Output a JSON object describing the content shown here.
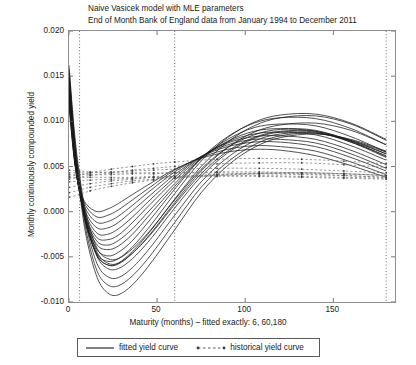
{
  "chart_data": {
    "type": "line",
    "title": "Naive Vasicek model with MLE parameters",
    "subtitle": "End of Month Bank of England data from January 1994 to December 2011",
    "xlabel": "Maturity (months) – fitted exactly: 6, 60,180",
    "ylabel": "Monthly continuously compounded yield",
    "xlim": [
      0,
      185
    ],
    "ylim": [
      -0.01,
      0.02
    ],
    "xticks": [
      0,
      50,
      100,
      150
    ],
    "xtick_labels": [
      "0",
      "50",
      "100",
      "150"
    ],
    "yticks": [
      0.02,
      0.015,
      0.01,
      0.005,
      0.0,
      -0.005,
      -0.01
    ],
    "ytick_labels": [
      "0.020",
      "0.015",
      "0.010",
      "0.005",
      "0.000",
      "-0.005",
      "-0.010"
    ],
    "grid": "vertical dotted gridlines at fitted maturities",
    "gridlines_x": [
      6,
      60,
      180
    ],
    "legend_position": "below-axis",
    "legend": [
      {
        "label": "fitted yield curve",
        "style": "solid",
        "color": "#1a1a1a"
      },
      {
        "label": "historical yield curve",
        "style": "dashed-with-markers",
        "color": "#7a7a7a"
      }
    ],
    "series": [
      {
        "name": "fitted yield curve 1",
        "style": "solid",
        "x": [
          0,
          3,
          6,
          10,
          16,
          22,
          28,
          36,
          46,
          60,
          75,
          90,
          105,
          120,
          140,
          160,
          180
        ],
        "y": [
          0.0162,
          0.009,
          0.004,
          -0.0005,
          -0.0041,
          -0.0052,
          -0.0052,
          -0.0041,
          -0.0021,
          0.0013,
          0.0047,
          0.0071,
          0.0085,
          0.0091,
          0.0089,
          0.0077,
          0.006
        ]
      },
      {
        "name": "fitted yield curve 2",
        "style": "solid",
        "x": [
          0,
          3,
          6,
          10,
          16,
          22,
          28,
          36,
          46,
          60,
          75,
          90,
          105,
          120,
          140,
          160,
          180
        ],
        "y": [
          0.0158,
          0.0085,
          0.0036,
          -0.0012,
          -0.005,
          -0.0063,
          -0.0063,
          -0.0052,
          -0.0031,
          0.0004,
          0.0039,
          0.0065,
          0.0081,
          0.0088,
          0.0088,
          0.0077,
          0.0062
        ]
      },
      {
        "name": "fitted yield curve 3",
        "style": "solid",
        "x": [
          0,
          3,
          6,
          10,
          16,
          22,
          28,
          36,
          46,
          60,
          75,
          90,
          105,
          120,
          140,
          160,
          180
        ],
        "y": [
          0.0155,
          0.008,
          0.0031,
          -0.0018,
          -0.0058,
          -0.0072,
          -0.0073,
          -0.0062,
          -0.004,
          -0.0004,
          0.0033,
          0.006,
          0.0078,
          0.0086,
          0.0087,
          0.0078,
          0.0064
        ]
      },
      {
        "name": "fitted yield curve 4",
        "style": "solid",
        "x": [
          0,
          3,
          6,
          10,
          16,
          22,
          28,
          36,
          46,
          60,
          75,
          90,
          105,
          120,
          140,
          160,
          180
        ],
        "y": [
          0.0152,
          0.0076,
          0.0027,
          -0.0024,
          -0.0066,
          -0.0081,
          -0.0082,
          -0.0071,
          -0.0049,
          -0.0012,
          0.0027,
          0.0055,
          0.0074,
          0.0084,
          0.0087,
          0.0079,
          0.0066
        ]
      },
      {
        "name": "fitted yield curve 5",
        "style": "solid",
        "x": [
          0,
          3,
          6,
          10,
          16,
          22,
          28,
          36,
          46,
          60,
          75,
          90,
          105,
          120,
          140,
          160,
          180
        ],
        "y": [
          0.015,
          0.0073,
          0.0022,
          -0.003,
          -0.0073,
          -0.009,
          -0.0092,
          -0.0081,
          -0.0058,
          -0.002,
          0.0021,
          0.0051,
          0.0071,
          0.0082,
          0.0086,
          0.008,
          0.0067
        ]
      },
      {
        "name": "fitted yield curve 6",
        "style": "solid",
        "x": [
          0,
          3,
          6,
          10,
          16,
          22,
          28,
          36,
          46,
          60,
          75,
          90,
          105,
          120,
          140,
          160,
          180
        ],
        "y": [
          0.0147,
          0.0078,
          0.0033,
          -0.001,
          -0.0045,
          -0.0057,
          -0.0057,
          -0.0046,
          -0.0026,
          0.0008,
          0.0042,
          0.0067,
          0.0082,
          0.0089,
          0.0089,
          0.0079,
          0.0064
        ]
      },
      {
        "name": "fitted yield curve 7",
        "style": "solid",
        "x": [
          0,
          3,
          6,
          10,
          16,
          22,
          28,
          36,
          46,
          60,
          75,
          90,
          105,
          120,
          140,
          160,
          180
        ],
        "y": [
          0.0144,
          0.0074,
          0.0029,
          -0.0014,
          -0.0048,
          -0.0059,
          -0.0058,
          -0.0046,
          -0.0025,
          0.001,
          0.0045,
          0.0071,
          0.0088,
          0.0096,
          0.0098,
          0.009,
          0.0074
        ]
      },
      {
        "name": "fitted yield curve 8",
        "style": "solid",
        "x": [
          0,
          3,
          6,
          10,
          16,
          22,
          28,
          36,
          46,
          60,
          75,
          90,
          105,
          120,
          140,
          160,
          180
        ],
        "y": [
          0.0141,
          0.0071,
          0.0026,
          -0.0016,
          -0.0049,
          -0.0059,
          -0.0057,
          -0.0044,
          -0.0022,
          0.0014,
          0.005,
          0.0077,
          0.0095,
          0.0104,
          0.0106,
          0.0097,
          0.0079
        ]
      },
      {
        "name": "fitted yield curve 9",
        "style": "solid",
        "x": [
          0,
          3,
          6,
          10,
          16,
          22,
          28,
          36,
          46,
          60,
          75,
          90,
          105,
          120,
          140,
          160,
          180
        ],
        "y": [
          0.0138,
          0.0069,
          0.0024,
          -0.0017,
          -0.0047,
          -0.0055,
          -0.0052,
          -0.0039,
          -0.0016,
          0.002,
          0.0056,
          0.0082,
          0.0099,
          0.0107,
          0.0108,
          0.0098,
          0.008
        ]
      },
      {
        "name": "fitted yield curve 10",
        "style": "solid",
        "x": [
          0,
          3,
          6,
          10,
          16,
          22,
          28,
          36,
          46,
          60,
          75,
          90,
          105,
          120,
          140,
          160,
          180
        ],
        "y": [
          0.0136,
          0.0067,
          0.0023,
          -0.0015,
          -0.0042,
          -0.0049,
          -0.0045,
          -0.0032,
          -0.0009,
          0.0025,
          0.0059,
          0.0083,
          0.0098,
          0.0104,
          0.0103,
          0.0092,
          0.0074
        ]
      },
      {
        "name": "fitted yield curve 11",
        "style": "solid",
        "x": [
          0,
          3,
          6,
          10,
          16,
          22,
          28,
          36,
          46,
          60,
          75,
          90,
          105,
          120,
          140,
          160,
          180
        ],
        "y": [
          0.0134,
          0.0066,
          0.0022,
          -0.0013,
          -0.0037,
          -0.0042,
          -0.0038,
          -0.0025,
          -0.0003,
          0.0028,
          0.0059,
          0.008,
          0.0093,
          0.0097,
          0.0095,
          0.0083,
          0.0066
        ]
      },
      {
        "name": "fitted yield curve 12",
        "style": "solid",
        "x": [
          0,
          3,
          6,
          10,
          16,
          22,
          28,
          36,
          46,
          60,
          75,
          90,
          105,
          120,
          140,
          160,
          180
        ],
        "y": [
          0.0132,
          0.0064,
          0.0021,
          -0.0011,
          -0.0033,
          -0.0037,
          -0.0032,
          -0.0019,
          0.0002,
          0.0031,
          0.0059,
          0.0078,
          0.0089,
          0.0092,
          0.009,
          0.0078,
          0.0061
        ]
      },
      {
        "name": "fitted yield curve 13",
        "style": "solid",
        "x": [
          0,
          3,
          6,
          10,
          16,
          22,
          28,
          36,
          46,
          60,
          75,
          90,
          105,
          120,
          140,
          160,
          180
        ],
        "y": [
          0.013,
          0.0063,
          0.0021,
          -0.0009,
          -0.0029,
          -0.0031,
          -0.0026,
          -0.0012,
          0.0008,
          0.0035,
          0.006,
          0.0077,
          0.0086,
          0.0088,
          0.0085,
          0.0073,
          0.0057
        ]
      },
      {
        "name": "fitted yield curve 14",
        "style": "solid",
        "x": [
          0,
          3,
          6,
          10,
          16,
          22,
          28,
          36,
          46,
          60,
          75,
          90,
          105,
          120,
          140,
          160,
          180
        ],
        "y": [
          0.0128,
          0.0062,
          0.0022,
          -0.0006,
          -0.0024,
          -0.0025,
          -0.0019,
          -0.0006,
          0.0013,
          0.0038,
          0.0061,
          0.0076,
          0.0083,
          0.0084,
          0.008,
          0.0068,
          0.0052
        ]
      },
      {
        "name": "fitted yield curve 15",
        "style": "solid",
        "x": [
          0,
          3,
          6,
          10,
          16,
          22,
          28,
          36,
          46,
          60,
          75,
          90,
          105,
          120,
          140,
          160,
          180
        ],
        "y": [
          0.0126,
          0.0061,
          0.0023,
          -0.0003,
          -0.0018,
          -0.0018,
          -0.0012,
          0.0001,
          0.0018,
          0.0041,
          0.0061,
          0.0074,
          0.008,
          0.008,
          0.0076,
          0.0064,
          0.0048
        ]
      },
      {
        "name": "fitted yield curve 16",
        "style": "solid",
        "x": [
          0,
          3,
          6,
          10,
          16,
          22,
          28,
          36,
          46,
          60,
          75,
          90,
          105,
          120,
          140,
          160,
          180
        ],
        "y": [
          0.0123,
          0.006,
          0.0024,
          0.0001,
          -0.0012,
          -0.0011,
          -0.0005,
          0.0007,
          0.0023,
          0.0044,
          0.0061,
          0.0072,
          0.0077,
          0.0077,
          0.0072,
          0.006,
          0.0045
        ]
      },
      {
        "name": "fitted yield curve 17",
        "style": "solid",
        "x": [
          0,
          3,
          6,
          10,
          16,
          22,
          28,
          36,
          46,
          60,
          75,
          90,
          105,
          120,
          140,
          160,
          180
        ],
        "y": [
          0.012,
          0.0059,
          0.0025,
          0.0005,
          -0.0006,
          -0.0004,
          0.0002,
          0.0013,
          0.0027,
          0.0046,
          0.006,
          0.0069,
          0.0073,
          0.0072,
          0.0067,
          0.0055,
          0.0041
        ]
      },
      {
        "name": "fitted yield curve 18",
        "style": "solid",
        "x": [
          0,
          3,
          6,
          10,
          16,
          22,
          28,
          36,
          46,
          60,
          75,
          90,
          105,
          120,
          140,
          160,
          180
        ],
        "y": [
          0.0117,
          0.0057,
          0.0025,
          0.0008,
          0.0,
          0.0003,
          0.0009,
          0.0019,
          0.0031,
          0.0047,
          0.0059,
          0.0066,
          0.0069,
          0.0068,
          0.0062,
          0.0051,
          0.0038
        ]
      },
      {
        "name": "historical yield curve 1",
        "style": "dashed",
        "x": [
          0,
          6,
          12,
          24,
          36,
          48,
          60,
          84,
          108,
          132,
          156,
          180
        ],
        "y": [
          0.0039,
          0.0041,
          0.0043,
          0.0047,
          0.005,
          0.0053,
          0.0055,
          0.0058,
          0.0059,
          0.0058,
          0.0056,
          0.0053
        ]
      },
      {
        "name": "historical yield curve 2",
        "style": "dashed",
        "x": [
          0,
          6,
          12,
          24,
          36,
          48,
          60,
          84,
          108,
          132,
          156,
          180
        ],
        "y": [
          0.0036,
          0.0038,
          0.004,
          0.0043,
          0.0046,
          0.0048,
          0.005,
          0.0053,
          0.0054,
          0.0054,
          0.0052,
          0.0049
        ]
      },
      {
        "name": "historical yield curve 3",
        "style": "dashed",
        "x": [
          0,
          6,
          12,
          24,
          36,
          48,
          60,
          84,
          108,
          132,
          156,
          180
        ],
        "y": [
          0.0043,
          0.0043,
          0.0043,
          0.0044,
          0.0045,
          0.0046,
          0.0047,
          0.0048,
          0.0048,
          0.0047,
          0.0045,
          0.0043
        ]
      },
      {
        "name": "historical yield curve 4",
        "style": "dashed",
        "x": [
          0,
          6,
          12,
          24,
          36,
          48,
          60,
          84,
          108,
          132,
          156,
          180
        ],
        "y": [
          0.0041,
          0.0041,
          0.0041,
          0.0041,
          0.0042,
          0.0042,
          0.0043,
          0.0044,
          0.0044,
          0.0043,
          0.0042,
          0.004
        ]
      },
      {
        "name": "historical yield curve 5",
        "style": "dashed",
        "x": [
          0,
          6,
          12,
          24,
          36,
          48,
          60,
          84,
          108,
          132,
          156,
          180
        ],
        "y": [
          0.0046,
          0.0045,
          0.0044,
          0.0043,
          0.0043,
          0.0043,
          0.0043,
          0.0043,
          0.0042,
          0.0041,
          0.004,
          0.0038
        ]
      },
      {
        "name": "historical yield curve 6",
        "style": "dashed",
        "x": [
          0,
          6,
          12,
          24,
          36,
          48,
          60,
          84,
          108,
          132,
          156,
          180
        ],
        "y": [
          0.0038,
          0.0038,
          0.0038,
          0.0038,
          0.0038,
          0.0039,
          0.0039,
          0.004,
          0.004,
          0.0039,
          0.0038,
          0.0037
        ]
      },
      {
        "name": "historical yield curve 7",
        "style": "dashed",
        "x": [
          0,
          6,
          12,
          24,
          36,
          48,
          60,
          84,
          108,
          132,
          156,
          180
        ],
        "y": [
          0.0033,
          0.0034,
          0.0035,
          0.0036,
          0.0037,
          0.0038,
          0.0038,
          0.0039,
          0.0039,
          0.0038,
          0.0037,
          0.0036
        ]
      },
      {
        "name": "historical yield curve 8",
        "style": "dashed",
        "x": [
          0,
          6,
          12,
          24,
          36,
          48,
          60,
          84,
          108,
          132,
          156,
          180
        ],
        "y": [
          0.0027,
          0.0029,
          0.0031,
          0.0034,
          0.0036,
          0.0038,
          0.0039,
          0.0041,
          0.0042,
          0.0042,
          0.004,
          0.0038
        ]
      },
      {
        "name": "historical yield curve 9",
        "style": "dashed",
        "x": [
          0,
          6,
          12,
          24,
          36,
          48,
          60,
          84,
          108,
          132,
          156,
          180
        ],
        "y": [
          0.0021,
          0.0024,
          0.0027,
          0.0031,
          0.0034,
          0.0036,
          0.0038,
          0.0041,
          0.0043,
          0.0043,
          0.0042,
          0.004
        ]
      },
      {
        "name": "historical yield curve 10",
        "style": "dashed",
        "x": [
          0,
          6,
          12,
          24,
          36,
          48,
          60,
          84,
          108,
          132,
          156,
          180
        ],
        "y": [
          0.0016,
          0.0019,
          0.0023,
          0.0028,
          0.0032,
          0.0035,
          0.0037,
          0.004,
          0.0042,
          0.0043,
          0.0042,
          0.004
        ]
      }
    ]
  }
}
